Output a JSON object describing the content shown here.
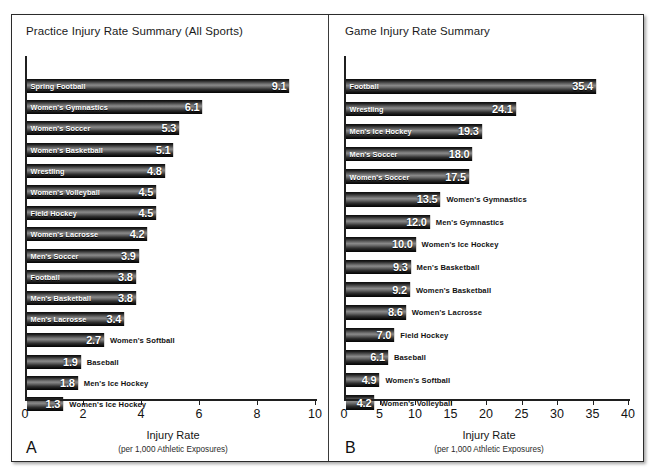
{
  "figure": {
    "panel_a_letter": "A",
    "panel_b_letter": "B"
  },
  "chart_data": [
    {
      "type": "bar",
      "orientation": "horizontal",
      "panel": "A",
      "title": "Practice Injury Rate Summary (All Sports)",
      "xlabel": "Injury Rate",
      "xlabel_sub": "(per 1,000 Athletic Exposures)",
      "ylabel": "",
      "xlim": [
        0,
        10
      ],
      "xticks": [
        0,
        2,
        4,
        6,
        8,
        10
      ],
      "xtick_labels": [
        "0",
        "2",
        "4",
        "6",
        "8",
        "10"
      ],
      "grid": false,
      "legend": "none",
      "categories": [
        "Spring Football",
        "Women's Gymnastics",
        "Women's Soccer",
        "Women's Basketball",
        "Wrestling",
        "Women's Volleyball",
        "Field Hockey",
        "Women's Lacrosse",
        "Men's Soccer",
        "Football",
        "Men's Basketball",
        "Men's Lacrosse",
        "Women's Softball",
        "Baseball",
        "Men's Ice Hockey",
        "Women's Ice Hockey"
      ],
      "values": [
        9.1,
        6.1,
        5.3,
        5.1,
        4.8,
        4.5,
        4.5,
        4.2,
        3.9,
        3.8,
        3.8,
        3.4,
        2.7,
        1.9,
        1.8,
        1.3
      ],
      "value_labels": [
        "9.1",
        "6.1",
        "5.3",
        "5.1",
        "4.8",
        "4.5",
        "4.5",
        "4.2",
        "3.9",
        "3.8",
        "3.8",
        "3.4",
        "2.7",
        "1.9",
        "1.8",
        "1.3"
      ],
      "label_placement": [
        "inside",
        "inside",
        "inside",
        "inside",
        "inside",
        "inside",
        "inside",
        "inside",
        "inside",
        "inside",
        "inside",
        "inside",
        "outside",
        "outside",
        "outside",
        "outside"
      ]
    },
    {
      "type": "bar",
      "orientation": "horizontal",
      "panel": "B",
      "title": "Game Injury Rate Summary",
      "xlabel": "Injury Rate",
      "xlabel_sub": "(per 1,000 Athletic Exposures)",
      "ylabel": "",
      "xlim": [
        0,
        40
      ],
      "xticks": [
        0,
        5,
        10,
        15,
        20,
        25,
        30,
        35,
        40
      ],
      "xtick_labels": [
        "0",
        "5",
        "10",
        "15",
        "20",
        "25",
        "30",
        "35",
        "40"
      ],
      "grid": false,
      "legend": "none",
      "categories": [
        "Football",
        "Wrestling",
        "Men's Ice Hockey",
        "Men's Soccer",
        "Women's Soccer",
        "Women's Gymnastics",
        "Men's Gymnastics",
        "Women's Ice Hockey",
        "Men's Basketball",
        "Women's Basketball",
        "Women's Lacrosse",
        "Field Hockey",
        "Baseball",
        "Women's Softball",
        "Women's Volleyball"
      ],
      "values": [
        35.4,
        24.1,
        19.3,
        18.0,
        17.5,
        13.5,
        12.0,
        10.0,
        9.3,
        9.2,
        8.6,
        7.0,
        6.1,
        4.9,
        4.2
      ],
      "value_labels": [
        "35.4",
        "24.1",
        "19.3",
        "18.0",
        "17.5",
        "13.5",
        "12.0",
        "10.0",
        "9.3",
        "9.2",
        "8.6",
        "7.0",
        "6.1",
        "4.9",
        "4.2"
      ],
      "label_placement": [
        "inside",
        "inside",
        "inside",
        "inside",
        "inside",
        "outside",
        "outside",
        "outside",
        "outside",
        "outside",
        "outside",
        "outside",
        "outside",
        "outside",
        "outside"
      ]
    }
  ]
}
